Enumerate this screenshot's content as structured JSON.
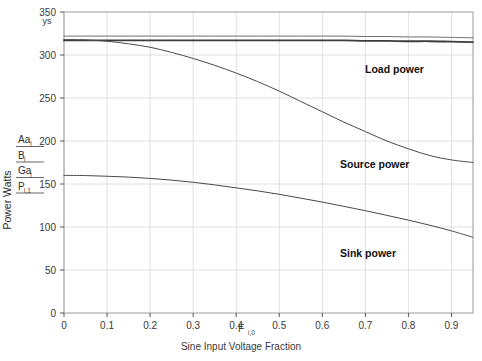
{
  "chart_data": {
    "type": "line",
    "title": "",
    "xlabel": "Sine Input Voltage Fraction",
    "xlabel_symbol": "F",
    "xlabel_symbol_sub": "i,0",
    "ylabel": "Power Watts",
    "ylabel_top_symbol": "ys",
    "xlim": [
      0,
      0.95
    ],
    "ylim": [
      0,
      350
    ],
    "grid": true,
    "legend_position": "y-axis-left-stack",
    "xticks": [
      0,
      0.1,
      0.2,
      0.3,
      0.4,
      0.5,
      0.6,
      0.7,
      0.8,
      0.9
    ],
    "xtick_labels": [
      "0",
      "0.1",
      "0.2",
      "0.3",
      "0.4",
      "0.5",
      "0.6",
      "0.7",
      "0.8",
      "0.9"
    ],
    "yticks": [
      0,
      50,
      100,
      150,
      200,
      250,
      300,
      350
    ],
    "ytick_labels": [
      "0",
      "50",
      "100",
      "150",
      "200",
      "250",
      "300",
      "350"
    ],
    "x": [
      0,
      0.05,
      0.1,
      0.15,
      0.2,
      0.25,
      0.3,
      0.35,
      0.4,
      0.45,
      0.5,
      0.55,
      0.6,
      0.65,
      0.7,
      0.75,
      0.8,
      0.85,
      0.9,
      0.95
    ],
    "series": [
      {
        "name": "Aa",
        "symbol": "Aa",
        "subscript": "i",
        "color": "#6e6e6e",
        "width": 1.0,
        "values": [
          322,
          322,
          322,
          322,
          322,
          322,
          322,
          322,
          322,
          322,
          322,
          322,
          322,
          322,
          321.5,
          321.5,
          321,
          321,
          320.5,
          320
        ]
      },
      {
        "name": "B",
        "symbol": "B",
        "subscript": "i",
        "color": "#3c3c3c",
        "width": 1.8,
        "values": [
          317,
          317,
          317,
          317,
          317,
          317,
          317,
          317,
          317,
          317,
          317,
          317,
          317,
          317,
          316.5,
          316.5,
          316,
          316,
          315.5,
          315
        ]
      },
      {
        "name": "Ga",
        "symbol": "Ga",
        "subscript": "i",
        "color": "#4a4a4a",
        "width": 1.0,
        "label": "Source power",
        "values": [
          318,
          317.5,
          316,
          313,
          309,
          303,
          296,
          288,
          279,
          269,
          258,
          246,
          234,
          222,
          211,
          200,
          191,
          183,
          178,
          175
        ]
      },
      {
        "name": "P",
        "symbol": "P",
        "subscript": "i,1",
        "color": "#4a4a4a",
        "width": 1.0,
        "label": "Sink power",
        "values": [
          160,
          159.8,
          159,
          158,
          156.5,
          154.5,
          152,
          149,
          145.5,
          142,
          138,
          133.5,
          129,
          124,
          119,
          113.5,
          108,
          102,
          95.5,
          88
        ]
      }
    ],
    "annotations": [
      {
        "text": "Load power",
        "x_px": 365,
        "y_px": 73
      },
      {
        "text": "Source power",
        "x_px": 340,
        "y_px": 168
      },
      {
        "text": "Sink power",
        "x_px": 340,
        "y_px": 257
      }
    ],
    "legend_stack": [
      {
        "symbol": "Aa",
        "subscript": "i"
      },
      {
        "symbol": "B",
        "subscript": "i"
      },
      {
        "symbol": "Ga",
        "subscript": "i"
      },
      {
        "symbol": "P",
        "subscript": "i,1"
      }
    ]
  }
}
